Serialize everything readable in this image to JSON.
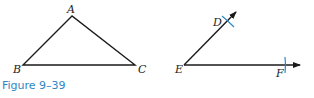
{
  "figure": {
    "caption": "Figure 9–39",
    "caption_color": "#2f86c3",
    "line_color": "#1a1a1a",
    "arc_color": "#2f86c3"
  },
  "triangle": {
    "vertices": [
      {
        "label": "A",
        "x": 72,
        "y": 16
      },
      {
        "label": "B",
        "x": 23,
        "y": 65
      },
      {
        "label": "C",
        "x": 135,
        "y": 65
      }
    ]
  },
  "angle": {
    "vertex": {
      "label": "E",
      "x": 184,
      "y": 65
    },
    "ray_points": [
      {
        "label": "D",
        "x": 228,
        "y": 20
      },
      {
        "label": "F",
        "x": 285,
        "y": 65
      }
    ]
  }
}
